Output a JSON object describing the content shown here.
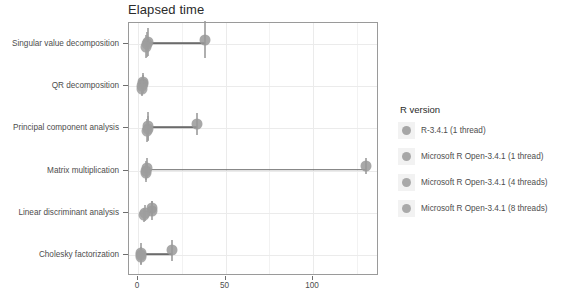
{
  "chart_data": {
    "type": "scatter",
    "title": "Elapsed time",
    "xlabel": "",
    "ylabel": "",
    "orientation": "horizontal",
    "grid": true,
    "legend_position": "right",
    "xlim": [
      -4,
      139
    ],
    "xticks": [
      0,
      50,
      100
    ],
    "xticklabels": [
      "0",
      "50",
      "100"
    ],
    "categories": [
      "Singular value decomposition",
      "QR decomposition",
      "Principal component analysis",
      "Matrix multiplication",
      "Linear discriminant analysis",
      "Cholesky factorization"
    ],
    "series": [
      {
        "name": "R-3.4.1 (1 thread)",
        "color": "#999999",
        "values": [
          39.0,
          3.5,
          34.0,
          131.0,
          8.5,
          20.0
        ],
        "errors": [
          12.0,
          5.5,
          7.0,
          5.0,
          5.0,
          7.0
        ]
      },
      {
        "name": "Microsoft R Open-3.4.1 (1 thread)",
        "color": "#9a9a9a",
        "values": [
          6.5,
          3.5,
          6.5,
          5.5,
          8.5,
          2.5
        ],
        "errors": [
          9.0,
          6.0,
          9.0,
          6.5,
          6.0,
          6.0
        ]
      },
      {
        "name": "Microsoft R Open-3.4.1 (4 threads)",
        "color": "#9c9c9c",
        "values": [
          5.5,
          3.0,
          6.0,
          5.0,
          4.5,
          2.0
        ],
        "errors": [
          8.0,
          5.5,
          8.0,
          6.0,
          5.0,
          5.5
        ]
      },
      {
        "name": "Microsoft R Open-3.4.1 (8 threads)",
        "color": "#9e9e9e",
        "values": [
          5.0,
          3.0,
          5.5,
          5.0,
          4.0,
          2.0
        ],
        "errors": [
          7.5,
          5.0,
          7.5,
          5.5,
          4.5,
          5.0
        ]
      }
    ]
  },
  "legend": {
    "title": "R version",
    "items": [
      {
        "label": "R-3.4.1 (1 thread)",
        "color": "#999999"
      },
      {
        "label": "Microsoft R Open-3.4.1 (1 thread)",
        "color": "#9a9a9a"
      },
      {
        "label": "Microsoft R Open-3.4.1 (4 threads)",
        "color": "#9c9c9c"
      },
      {
        "label": "Microsoft R Open-3.4.1 (8 threads)",
        "color": "#9e9e9e"
      }
    ]
  },
  "colors": {
    "panel_border": "#9a9a9a",
    "grid": "#ebebeb",
    "connector": "#6b6b6b",
    "text": "#4d4d4d",
    "title": "#2b2b2b"
  }
}
